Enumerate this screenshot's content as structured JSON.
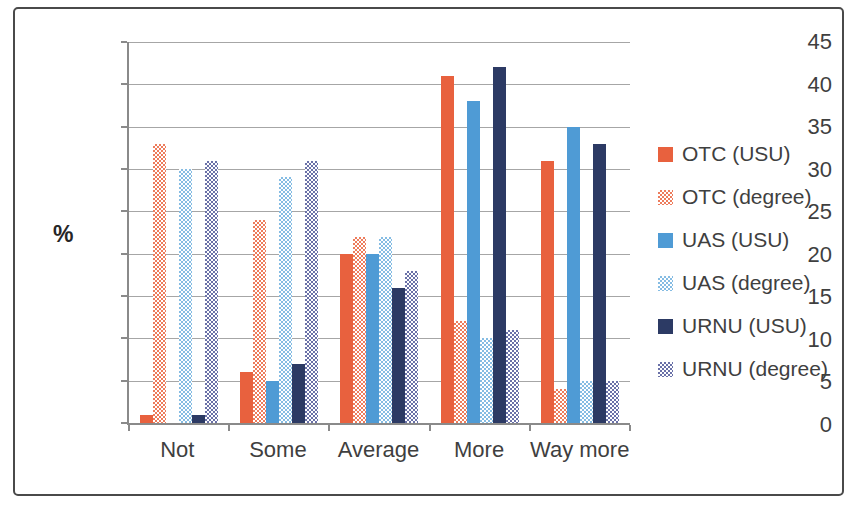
{
  "chart_data": {
    "type": "bar",
    "title": "",
    "xlabel": "",
    "ylabel": "%",
    "ylim": [
      0,
      45
    ],
    "ytick_step": 5,
    "yticks": [
      0,
      5,
      10,
      15,
      20,
      25,
      30,
      35,
      40,
      45
    ],
    "grid": true,
    "legend_position": "right",
    "categories": [
      "Not",
      "Some",
      "Average",
      "More",
      "Way more"
    ],
    "series": [
      {
        "name": "OTC (USU)",
        "pattern": "solid",
        "color": "#e8613e",
        "values": [
          1,
          6,
          20,
          41,
          31
        ]
      },
      {
        "name": "OTC (degree)",
        "pattern": "dotted",
        "color": "#ed7c5c",
        "values": [
          33,
          24,
          22,
          12,
          4
        ]
      },
      {
        "name": "UAS (USU)",
        "pattern": "solid",
        "color": "#4f9bd5",
        "values": [
          0,
          5,
          20,
          38,
          35
        ]
      },
      {
        "name": "UAS (degree)",
        "pattern": "dotted",
        "color": "#85bce3",
        "values": [
          30,
          29,
          22,
          10,
          5
        ]
      },
      {
        "name": "URNU (USU)",
        "pattern": "solid",
        "color": "#2c3a64",
        "values": [
          1,
          7,
          16,
          42,
          33
        ]
      },
      {
        "name": "URNU (degree)",
        "pattern": "dotted",
        "color": "#6a71a8",
        "values": [
          31,
          31,
          18,
          11,
          5
        ]
      }
    ],
    "style": {
      "background": "#ffffff",
      "frame_border_color": "#4a4a4a",
      "axis_color": "#8a8a8a",
      "grid_color": "#a6a6a6",
      "text_color": "#3f3f3f"
    }
  }
}
